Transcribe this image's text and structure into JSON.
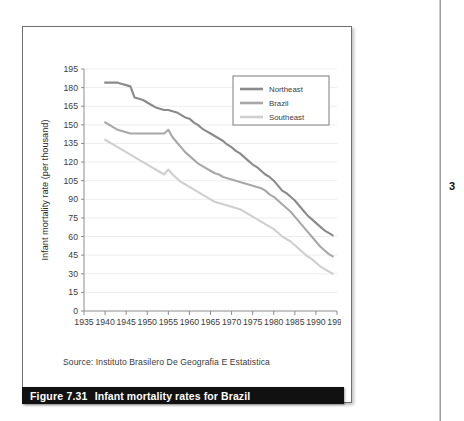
{
  "figure": {
    "caption_number": "Figure 7.31",
    "caption_text": "Infant mortality rates for Brazil",
    "source": "Source: Instituto Brasilero De  Geografia E Estatistica",
    "page_number": "3"
  },
  "chart_data": {
    "type": "line",
    "title": "Infant mortality rates for Brazil",
    "xlabel": "",
    "ylabel": "Infant mortality rate (per thousand)",
    "xlim": [
      1935,
      1995
    ],
    "ylim": [
      0,
      195
    ],
    "xticks": [
      1935,
      1940,
      1945,
      1950,
      1955,
      1960,
      1965,
      1970,
      1975,
      1980,
      1985,
      1990,
      1995
    ],
    "yticks": [
      0,
      15,
      30,
      45,
      60,
      75,
      90,
      105,
      120,
      135,
      150,
      165,
      180,
      195
    ],
    "grid": true,
    "legend_position": "top-right",
    "colors": {
      "northeast": "#8a8a8a",
      "brazil": "#a8a8a8",
      "southeast": "#cfcfcf",
      "grid": "#ededed",
      "axis": "#8d8d8d"
    },
    "x": [
      1940,
      1941,
      1942,
      1943,
      1944,
      1945,
      1946,
      1947,
      1948,
      1949,
      1950,
      1951,
      1952,
      1953,
      1954,
      1955,
      1956,
      1957,
      1958,
      1959,
      1960,
      1961,
      1962,
      1963,
      1964,
      1965,
      1966,
      1967,
      1968,
      1969,
      1970,
      1971,
      1972,
      1973,
      1974,
      1975,
      1976,
      1977,
      1978,
      1979,
      1980,
      1981,
      1982,
      1983,
      1984,
      1985,
      1986,
      1987,
      1988,
      1989,
      1990,
      1991,
      1992,
      1993,
      1994
    ],
    "series": [
      {
        "name": "Northeast",
        "color": "#8a8a8a",
        "values": [
          184,
          184,
          184,
          184,
          183,
          182,
          181,
          172,
          171,
          170,
          168,
          166,
          164,
          163,
          162,
          162,
          161,
          160,
          158,
          156,
          155,
          152,
          150,
          147,
          145,
          143,
          141,
          139,
          137,
          134,
          132,
          129,
          127,
          124,
          121,
          118,
          116,
          113,
          110,
          108,
          105,
          101,
          97,
          95,
          92,
          89,
          85,
          81,
          77,
          74,
          71,
          68,
          65,
          63,
          61
        ]
      },
      {
        "name": "Brazil",
        "color": "#a8a8a8",
        "values": [
          152,
          150,
          148,
          146,
          145,
          144,
          143,
          143,
          143,
          143,
          143,
          143,
          143,
          143,
          143,
          146,
          140,
          136,
          132,
          128,
          125,
          122,
          119,
          117,
          115,
          113,
          111,
          110,
          108,
          107,
          106,
          105,
          104,
          103,
          102,
          101,
          100,
          99,
          97,
          94,
          92,
          89,
          86,
          83,
          80,
          76,
          72,
          68,
          64,
          60,
          56,
          52,
          49,
          46,
          44
        ]
      },
      {
        "name": "Southeast",
        "color": "#cfcfcf",
        "values": [
          138,
          136,
          134,
          132,
          130,
          128,
          126,
          124,
          122,
          120,
          118,
          116,
          114,
          112,
          110,
          114,
          110,
          107,
          104,
          102,
          100,
          98,
          96,
          94,
          92,
          90,
          88,
          87,
          86,
          85,
          84,
          83,
          82,
          80,
          78,
          76,
          74,
          72,
          70,
          68,
          66,
          63,
          60,
          58,
          56,
          53,
          50,
          47,
          44,
          42,
          39,
          36,
          34,
          32,
          30
        ]
      }
    ]
  }
}
